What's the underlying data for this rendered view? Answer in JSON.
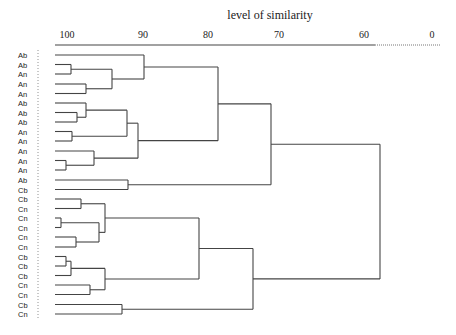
{
  "chart_data": {
    "type": "dendrogram",
    "title": "level of similarity",
    "xlabel": "level of similarity",
    "ylabel": "",
    "x_ticks": [
      {
        "label": "100",
        "x": 67
      },
      {
        "label": "90",
        "x": 143
      },
      {
        "label": "80",
        "x": 208
      },
      {
        "label": "70",
        "x": 279
      },
      {
        "label": "60",
        "x": 364
      },
      {
        "label": "0",
        "x": 432
      }
    ],
    "axis": {
      "solid_from": 55,
      "solid_to": 375,
      "dotted_to": 440,
      "y": 31
    },
    "leaves": [
      "Ab",
      "Ab",
      "An",
      "An",
      "An",
      "Ab",
      "Ab",
      "Ab",
      "An",
      "An",
      "An",
      "An",
      "An",
      "Ab",
      "Cb",
      "Cb",
      "Cn",
      "Cn",
      "Cn",
      "Cn",
      "Cn",
      "Cb",
      "Cb",
      "Cb",
      "Cn",
      "Cn",
      "Cb",
      "Cn"
    ],
    "leaf_y": [
      55,
      64.5,
      74,
      84,
      93.5,
      103,
      112.5,
      122,
      131.5,
      141,
      151,
      160.5,
      170,
      180,
      189.5,
      199,
      208.5,
      218,
      227.5,
      237,
      247,
      256.5,
      266,
      275.5,
      285,
      294.5,
      304.5,
      314
    ],
    "leaf_x": 55,
    "merges": [
      {
        "id": "m1",
        "a": "L1",
        "b": "L2",
        "x": 71
      },
      {
        "id": "m2",
        "a": "L3",
        "b": "L4",
        "x": 86
      },
      {
        "id": "m3",
        "a": "m1",
        "b": "m2",
        "x": 112
      },
      {
        "id": "m4",
        "a": "L0",
        "b": "m3",
        "x": 144
      },
      {
        "id": "m5",
        "a": "L6",
        "b": "L7",
        "x": 77
      },
      {
        "id": "m6",
        "a": "L5",
        "b": "m5",
        "x": 86
      },
      {
        "id": "m7",
        "a": "L8",
        "b": "L9",
        "x": 72
      },
      {
        "id": "m8",
        "a": "m6",
        "b": "m7",
        "x": 127
      },
      {
        "id": "m9",
        "a": "L11",
        "b": "L12",
        "x": 66
      },
      {
        "id": "m10",
        "a": "L10",
        "b": "m9",
        "x": 94
      },
      {
        "id": "m11",
        "a": "m8",
        "b": "m10",
        "x": 138
      },
      {
        "id": "m12",
        "a": "m4",
        "b": "m11",
        "x": 218
      },
      {
        "id": "m13",
        "a": "L13",
        "b": "L14",
        "x": 128
      },
      {
        "id": "m14",
        "a": "m12",
        "b": "m13",
        "x": 271
      },
      {
        "id": "m15",
        "a": "L15",
        "b": "L16",
        "x": 81
      },
      {
        "id": "m16",
        "a": "L17",
        "b": "L18",
        "x": 61
      },
      {
        "id": "m17",
        "a": "L19",
        "b": "L20",
        "x": 76
      },
      {
        "id": "m18",
        "a": "m16",
        "b": "m17",
        "x": 99
      },
      {
        "id": "m19",
        "a": "m15",
        "b": "m18",
        "x": 105
      },
      {
        "id": "m20",
        "a": "L21",
        "b": "L22",
        "x": 66
      },
      {
        "id": "m21",
        "a": "m20",
        "b": "L23",
        "x": 71
      },
      {
        "id": "m22",
        "a": "L24",
        "b": "L25",
        "x": 90
      },
      {
        "id": "m23",
        "a": "m21",
        "b": "m22",
        "x": 105
      },
      {
        "id": "m24",
        "a": "m19",
        "b": "m23",
        "x": 199
      },
      {
        "id": "m25",
        "a": "L26",
        "b": "L27",
        "x": 122
      },
      {
        "id": "m26",
        "a": "m24",
        "b": "m25",
        "x": 253
      },
      {
        "id": "m27",
        "a": "m14",
        "b": "m26",
        "x": 380
      }
    ],
    "legend": null,
    "grid": false
  }
}
